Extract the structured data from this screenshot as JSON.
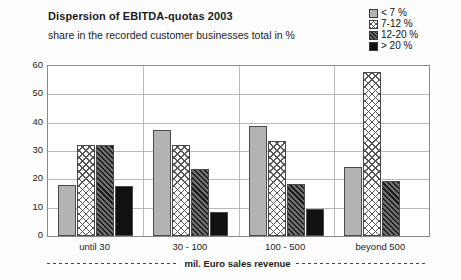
{
  "header": {
    "title": "Dispersion of EBITDA-quotas 2003",
    "subtitle": "share in the recorded customer businesses total in %"
  },
  "legend": {
    "position": "top-right",
    "items": [
      {
        "label": "< 7 %",
        "pattern": "solid-gray",
        "color": "#b3b3b3"
      },
      {
        "label": "7-12 %",
        "pattern": "cross-hatch",
        "color": "#ffffff"
      },
      {
        "label": "12-20 %",
        "pattern": "diagonal-dark",
        "color": "#6f6f6f"
      },
      {
        "label": "> 20 %",
        "pattern": "solid-black",
        "color": "#111111"
      }
    ]
  },
  "axes": {
    "y_ticks": [
      "60",
      "50",
      "40",
      "30",
      "20",
      "10",
      "0"
    ],
    "x_title": "mil. Euro sales revenue"
  },
  "chart_data": {
    "type": "bar",
    "title": "Dispersion of EBITDA-quotas 2003",
    "subtitle": "share in the recorded customer businesses total in %",
    "xlabel": "mil. Euro sales revenue",
    "ylabel": "",
    "ylim": [
      0,
      60
    ],
    "ytick_step": 10,
    "grid": true,
    "legend_position": "top-right",
    "categories": [
      "until 30",
      "30 - 100",
      "100 - 500",
      "beyond  500"
    ],
    "series": [
      {
        "name": "< 7 %",
        "values": [
          18,
          37.5,
          39,
          24.5
        ]
      },
      {
        "name": "7-12 %",
        "values": [
          32,
          32,
          33.5,
          58
        ]
      },
      {
        "name": "12-20 %",
        "values": [
          32,
          23.5,
          18.5,
          19.5
        ]
      },
      {
        "name": "> 20 %",
        "values": [
          17.5,
          8.5,
          9.5,
          null
        ]
      }
    ]
  }
}
